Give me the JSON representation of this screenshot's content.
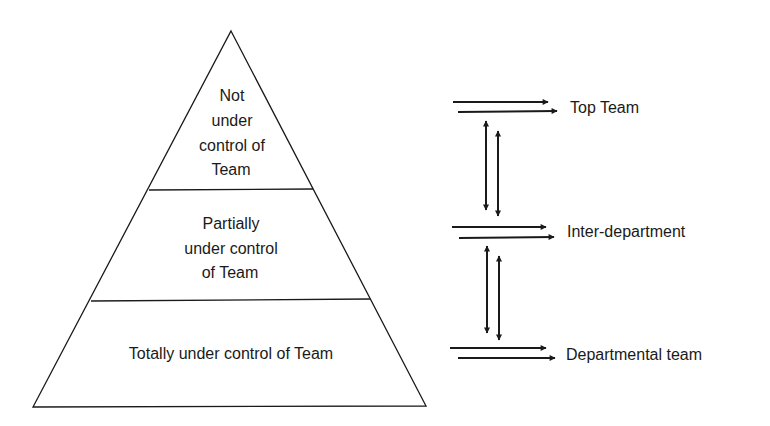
{
  "diagram": {
    "type": "pyramid-with-flows",
    "colors": {
      "line": "#1a1a1a",
      "background": "#ffffff",
      "text": "#1a1a1a"
    },
    "pyramid": {
      "tiers": [
        {
          "id": "top",
          "lines": [
            "Not",
            "under",
            "control of",
            "Team"
          ]
        },
        {
          "id": "middle",
          "lines": [
            "Partially",
            "under control",
            "of Team"
          ]
        },
        {
          "id": "bottom",
          "lines": [
            "Totally under control of Team"
          ]
        }
      ]
    },
    "levels": [
      {
        "label": "Top Team"
      },
      {
        "label": "Inter-department"
      },
      {
        "label": "Departmental team"
      }
    ],
    "connectors": [
      {
        "from": "Top Team",
        "to": "Inter-department",
        "type": "bidirectional-pair"
      },
      {
        "from": "Inter-department",
        "to": "Departmental team",
        "type": "bidirectional-pair"
      }
    ]
  }
}
